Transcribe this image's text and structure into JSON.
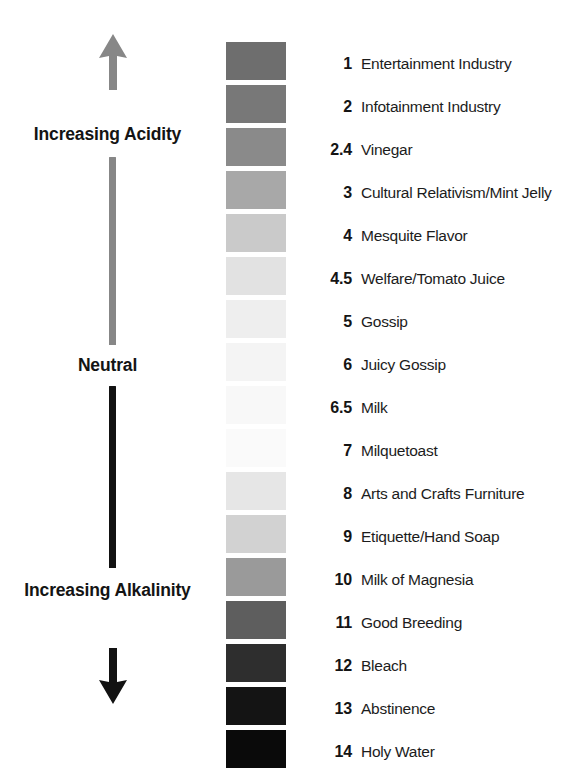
{
  "diagram": {
    "axis": {
      "top_arrow_icon": "arrow-up-icon",
      "bottom_arrow_icon": "arrow-down-icon",
      "top_arrow_color": "#878787",
      "bottom_arrow_color": "#121212",
      "upper_line_color": "#878787",
      "lower_line_color": "#121212",
      "labels": {
        "acidity": "Increasing Acidity",
        "neutral": "Neutral",
        "alkalinity": "Increasing Alkalinity"
      }
    },
    "legend": [
      {
        "number": "1",
        "name": "Entertainment Industry",
        "swatch": "#6e6e6e"
      },
      {
        "number": "2",
        "name": "Infotainment Industry",
        "swatch": "#787878"
      },
      {
        "number": "2.4",
        "name": "Vinegar",
        "swatch": "#8a8a8a"
      },
      {
        "number": "3",
        "name": "Cultural Relativism/Mint Jelly",
        "swatch": "#a8a8a8"
      },
      {
        "number": "4",
        "name": "Mesquite Flavor",
        "swatch": "#cacaca"
      },
      {
        "number": "4.5",
        "name": "Welfare/Tomato Juice",
        "swatch": "#e2e2e2"
      },
      {
        "number": "5",
        "name": "Gossip",
        "swatch": "#eeeeee"
      },
      {
        "number": "6",
        "name": "Juicy Gossip",
        "swatch": "#f4f4f4"
      },
      {
        "number": "6.5",
        "name": "Milk",
        "swatch": "#f8f8f8"
      },
      {
        "number": "7",
        "name": "Milquetoast",
        "swatch": "#fafafa"
      },
      {
        "number": "8",
        "name": "Arts and Crafts Furniture",
        "swatch": "#e6e6e6"
      },
      {
        "number": "9",
        "name": "Etiquette/Hand Soap",
        "swatch": "#d2d2d2"
      },
      {
        "number": "10",
        "name": "Milk of Magnesia",
        "swatch": "#9a9a9a"
      },
      {
        "number": "11",
        "name": "Good Breeding",
        "swatch": "#5e5e5e"
      },
      {
        "number": "12",
        "name": "Bleach",
        "swatch": "#2e2e2e"
      },
      {
        "number": "13",
        "name": "Abstinence",
        "swatch": "#141414"
      },
      {
        "number": "14",
        "name": "Holy Water",
        "swatch": "#0a0a0a"
      }
    ]
  },
  "chart_data": {
    "type": "table",
    "categories": [
      "1",
      "2",
      "2.4",
      "3",
      "4",
      "4.5",
      "5",
      "6",
      "6.5",
      "7",
      "8",
      "9",
      "10",
      "11",
      "12",
      "13",
      "14"
    ],
    "values": [
      1,
      2,
      2.4,
      3,
      4,
      4.5,
      5,
      6,
      6.5,
      7,
      8,
      9,
      10,
      11,
      12,
      13,
      14
    ],
    "labels": [
      "Entertainment Industry",
      "Infotainment Industry",
      "Vinegar",
      "Cultural Relativism/Mint Jelly",
      "Mesquite Flavor",
      "Welfare/Tomato Juice",
      "Gossip",
      "Juicy Gossip",
      "Milk",
      "Milquetoast",
      "Arts and Crafts Furniture",
      "Etiquette/Hand Soap",
      "Milk of Magnesia",
      "Good Breeding",
      "Bleach",
      "Abstinence",
      "Holy Water"
    ],
    "swatch_colors": [
      "#6e6e6e",
      "#787878",
      "#8a8a8a",
      "#a8a8a8",
      "#cacaca",
      "#e2e2e2",
      "#eeeeee",
      "#f4f4f4",
      "#f8f8f8",
      "#fafafa",
      "#e6e6e6",
      "#d2d2d2",
      "#9a9a9a",
      "#5e5e5e",
      "#2e2e2e",
      "#141414",
      "#0a0a0a"
    ],
    "xlabel": "",
    "ylabel": "pH",
    "ylim": [
      1,
      14
    ],
    "axis_annotations": [
      "Increasing Acidity",
      "Neutral",
      "Increasing Alkalinity"
    ],
    "grid": false,
    "legend": "right"
  }
}
